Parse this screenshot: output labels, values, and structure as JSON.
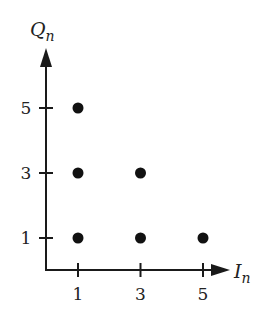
{
  "chart_data": {
    "type": "scatter",
    "title": "",
    "xlabel": "I",
    "xlabel_sub": "n",
    "ylabel": "Q",
    "ylabel_sub": "n",
    "x_ticks": [
      1,
      3,
      5
    ],
    "y_ticks": [
      1,
      3,
      5
    ],
    "points": [
      {
        "x": 1,
        "y": 1
      },
      {
        "x": 3,
        "y": 1
      },
      {
        "x": 5,
        "y": 1
      },
      {
        "x": 1,
        "y": 3
      },
      {
        "x": 3,
        "y": 3
      },
      {
        "x": 1,
        "y": 5
      }
    ],
    "grid": false,
    "legend": null,
    "colors": {
      "axis": "#1a1a1a",
      "point": "#111111"
    }
  }
}
